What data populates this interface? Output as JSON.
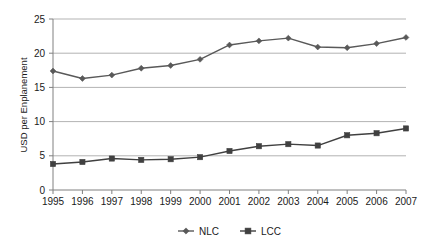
{
  "chart_data": {
    "type": "line",
    "title": "",
    "xlabel": "",
    "ylabel": "USD per Enplanement",
    "categories": [
      "1995",
      "1996",
      "1997",
      "1998",
      "1999",
      "2000",
      "2001",
      "2002",
      "2003",
      "2004",
      "2005",
      "2006",
      "2007"
    ],
    "x": [
      1995,
      1996,
      1997,
      1998,
      1999,
      2000,
      2001,
      2002,
      2003,
      2004,
      2005,
      2006,
      2007
    ],
    "series": [
      {
        "name": "NLC",
        "marker": "diamond",
        "color": "#595959",
        "values": [
          17.4,
          16.3,
          16.8,
          17.8,
          18.2,
          19.1,
          21.2,
          21.8,
          22.2,
          20.9,
          20.8,
          21.4,
          22.3
        ]
      },
      {
        "name": "LCC",
        "marker": "square",
        "color": "#404040",
        "values": [
          3.8,
          4.1,
          4.6,
          4.4,
          4.5,
          4.8,
          5.7,
          6.4,
          6.7,
          6.5,
          8.0,
          8.3,
          9.0
        ]
      }
    ],
    "ylim": [
      0,
      25
    ],
    "yticks": [
      0,
      5,
      10,
      15,
      20,
      25
    ],
    "ytick_labels": [
      "0",
      "5",
      "10",
      "15",
      "20",
      "25"
    ],
    "grid": true,
    "grid_axis": "y",
    "legend_position": "bottom",
    "gridline_color": "#b3b3b3",
    "axis_color": "#808080",
    "background_color": "#ffffff"
  },
  "legend": {
    "entries": [
      {
        "label": "NLC",
        "marker_name": "diamond-marker"
      },
      {
        "label": "LCC",
        "marker_name": "square-marker"
      }
    ]
  },
  "axes": {
    "y_title": "USD per Enplanement"
  }
}
